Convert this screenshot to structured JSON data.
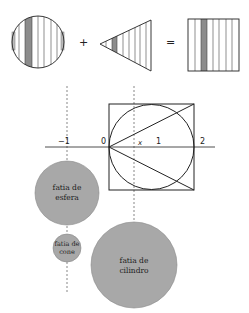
{
  "top_equation": {
    "operators": {
      "plus": "+",
      "equals": "="
    },
    "items": [
      "sphere-slices",
      "cone-slices",
      "cylinder-slices"
    ]
  },
  "axis": {
    "tick_labels": {
      "minus_one": "−1",
      "zero": "0",
      "x": "x",
      "one": "1",
      "two": "2"
    }
  },
  "slices": {
    "sphere": {
      "line1": "fatia de",
      "line2": "esfera"
    },
    "cone": {
      "line1": "fatia de",
      "line2": "cone"
    },
    "cylinder": {
      "line1": "fatia de",
      "line2": "cilindro"
    }
  },
  "colors": {
    "stroke": "#222222",
    "fill_gray": "#a8a8a8",
    "strip_gray": "#8c8c8c",
    "background": "#ffffff"
  }
}
